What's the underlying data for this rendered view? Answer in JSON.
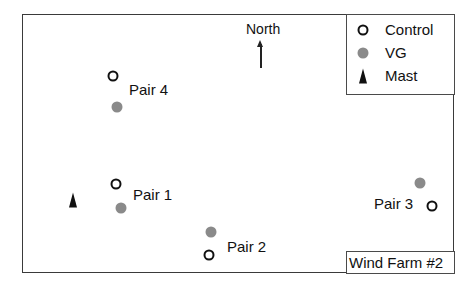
{
  "diagram": {
    "title": "Wind Farm #2",
    "north_label": "North",
    "legend": {
      "items": [
        {
          "symbol": "open-circle",
          "label": "Control"
        },
        {
          "symbol": "gray-dot",
          "label": "VG"
        },
        {
          "symbol": "triangle",
          "label": "Mast"
        }
      ]
    },
    "pairs": [
      {
        "label": "Pair 1",
        "control": {
          "x": 116,
          "y": 184
        },
        "vg": {
          "x": 121,
          "y": 208
        },
        "label_pos": {
          "x": 133,
          "y": 186
        }
      },
      {
        "label": "Pair 2",
        "control": {
          "x": 209,
          "y": 255
        },
        "vg": {
          "x": 211,
          "y": 232
        },
        "label_pos": {
          "x": 227,
          "y": 238
        }
      },
      {
        "label": "Pair 3",
        "control": {
          "x": 432,
          "y": 206
        },
        "vg": {
          "x": 420,
          "y": 183
        },
        "label_pos": {
          "x": 374,
          "y": 195
        }
      },
      {
        "label": "Pair 4",
        "control": {
          "x": 113,
          "y": 76
        },
        "vg": {
          "x": 117,
          "y": 107
        },
        "label_pos": {
          "x": 129,
          "y": 81
        }
      }
    ],
    "mast": {
      "x": 73,
      "y": 200
    },
    "colors": {
      "control_stroke": "#111111",
      "vg_fill": "#8a8a8a",
      "mast_fill": "#111111",
      "frame": "#3a3a3a"
    }
  }
}
